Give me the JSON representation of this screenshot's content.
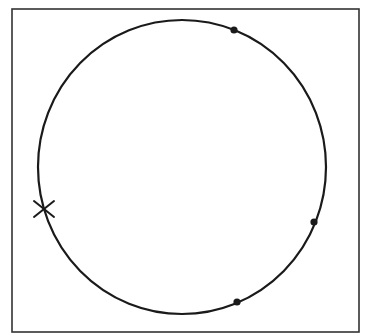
{
  "diagram": {
    "frame": {
      "x": 12,
      "y": 9,
      "width": 347,
      "height": 323,
      "stroke": "#333333",
      "stroke_width": 1.6
    },
    "curve": {
      "cx": 182,
      "cy": 167,
      "rx": 144,
      "ry": 147,
      "stroke": "#1a1a1a",
      "stroke_width": 2.2
    },
    "dots": [
      {
        "id": "dot-top-right",
        "x": 234,
        "y": 30,
        "r": 3.6
      },
      {
        "id": "dot-right",
        "x": 314,
        "y": 222,
        "r": 3.6
      },
      {
        "id": "dot-bottom",
        "x": 237,
        "y": 302,
        "r": 3.6
      }
    ],
    "cross": {
      "id": "cross-left",
      "x": 44,
      "y": 209,
      "size": 10
    },
    "colors": {
      "background": "#ffffff",
      "ink": "#1a1a1a",
      "frame": "#333333"
    }
  }
}
